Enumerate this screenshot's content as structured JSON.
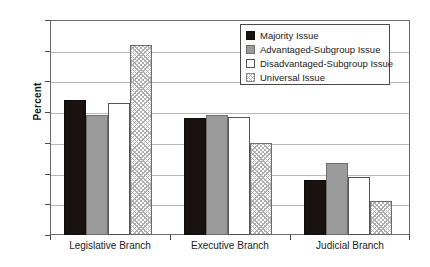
{
  "chart_data": {
    "type": "bar",
    "title": "",
    "xlabel": "",
    "ylabel": "Percent",
    "ylim": [
      0,
      70
    ],
    "yticks": [
      0,
      10,
      20,
      30,
      40,
      50,
      60,
      70
    ],
    "ytick_labels": [
      "0",
      "10",
      "20",
      "30",
      "40",
      "50",
      "60",
      "70"
    ],
    "grid": true,
    "legend_position": "top-right",
    "categories": [
      "Legislative Branch",
      "Executive Branch",
      "Judicial Branch"
    ],
    "series": [
      {
        "name": "Majority Issue",
        "values": [
          44,
          38,
          18
        ],
        "color": "#1a1210",
        "pattern": "solid"
      },
      {
        "name": "Advantaged-Subgroup Issue",
        "values": [
          39,
          39,
          23.5
        ],
        "color": "#9b9b9b",
        "pattern": "solid"
      },
      {
        "name": "Disadvantaged-Subgroup Issue",
        "values": [
          43,
          38.5,
          19
        ],
        "color": "#ffffff",
        "pattern": "outline"
      },
      {
        "name": "Universal Issue",
        "values": [
          62,
          30,
          11
        ],
        "color": "#ffffff",
        "pattern": "hatched"
      }
    ]
  },
  "axis": {
    "y_title": "Percent"
  },
  "legend": {
    "entries": [
      {
        "label": "Majority Issue",
        "swatch": "majority"
      },
      {
        "label": "Advantaged-Subgroup Issue",
        "swatch": "advantaged"
      },
      {
        "label": "Disadvantaged-Subgroup Issue",
        "swatch": "disadvantaged"
      },
      {
        "label": "Universal Issue",
        "swatch": "universal"
      }
    ]
  },
  "colors": {
    "majority": "#1a1210",
    "advantaged": "#9b9b9b",
    "disadvantaged": "#ffffff",
    "universal": "#b0b0b0",
    "frame": "#6b6b6b",
    "grid": "#b9b9b9",
    "text": "#1a1a1a"
  }
}
